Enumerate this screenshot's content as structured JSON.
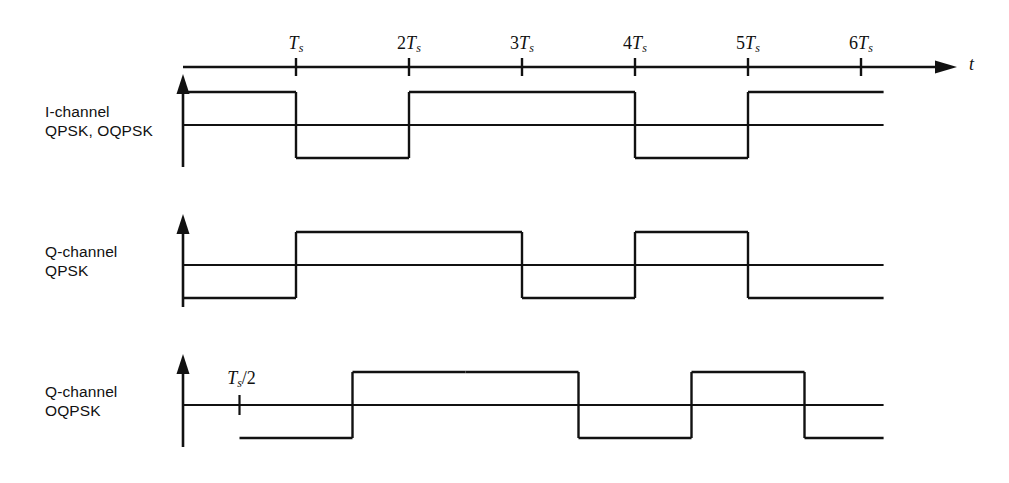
{
  "figure": {
    "background_color": "#ffffff",
    "line_color": "#111111"
  },
  "axis": {
    "time_axis_name": "t",
    "tick_labels": [
      {
        "label_prefix": "",
        "symbol": "T",
        "subscript": "s",
        "value": 1
      },
      {
        "label_prefix": "2",
        "symbol": "T",
        "subscript": "s",
        "value": 2
      },
      {
        "label_prefix": "3",
        "symbol": "T",
        "subscript": "s",
        "value": 3
      },
      {
        "label_prefix": "4",
        "symbol": "T",
        "subscript": "s",
        "value": 4
      },
      {
        "label_prefix": "5",
        "symbol": "T",
        "subscript": "s",
        "value": 5
      },
      {
        "label_prefix": "6",
        "symbol": "T",
        "subscript": "s",
        "value": 6
      }
    ],
    "offset_annotation": {
      "symbol": "T",
      "subscript": "s",
      "suffix": "/2",
      "value": 0.5
    }
  },
  "traces": [
    {
      "id": "i-channel",
      "label_line1": "I-channel",
      "label_line2": "QPSK, OQPSK",
      "delay": 0,
      "start": 0,
      "end": 6.2
    },
    {
      "id": "q-channel-qpsk",
      "label_line1": "Q-channel",
      "label_line2": "QPSK",
      "delay": 0,
      "start": 0,
      "end": 6.2
    },
    {
      "id": "q-channel-oqpsk",
      "label_line1": "Q-channel",
      "label_line2": "OQPSK",
      "delay": 0.5,
      "start": 0.5,
      "end": 6.2
    }
  ],
  "chart_data": {
    "type": "line",
    "xlabel": "t",
    "ylabel": "",
    "xlim": [
      0,
      6.2
    ],
    "ylim": [
      -1.4,
      1.4
    ],
    "grid": false,
    "legend": "none",
    "x_tick_values": [
      1,
      2,
      3,
      4,
      5,
      6
    ],
    "x_tick_labels": [
      "Ts",
      "2Ts",
      "3Ts",
      "4Ts",
      "5Ts",
      "6Ts"
    ],
    "x_unit": "Ts",
    "waveform_style": "NRZ bipolar square wave",
    "series": [
      {
        "name": "I-channel QPSK, OQPSK",
        "delay": 0,
        "levels": [
          1,
          -1,
          1,
          1,
          -1,
          1
        ],
        "segments": [
          {
            "t_start": 0,
            "t_end": 1,
            "level": 1
          },
          {
            "t_start": 1,
            "t_end": 2,
            "level": -1
          },
          {
            "t_start": 2,
            "t_end": 3,
            "level": 1
          },
          {
            "t_start": 3,
            "t_end": 4,
            "level": 1
          },
          {
            "t_start": 4,
            "t_end": 5,
            "level": -1
          },
          {
            "t_start": 5,
            "t_end": 6.2,
            "level": 1
          }
        ]
      },
      {
        "name": "Q-channel QPSK",
        "delay": 0,
        "levels": [
          -1,
          1,
          1,
          -1,
          1,
          -1
        ],
        "segments": [
          {
            "t_start": 0,
            "t_end": 1,
            "level": -1
          },
          {
            "t_start": 1,
            "t_end": 2,
            "level": 1
          },
          {
            "t_start": 2,
            "t_end": 3,
            "level": 1
          },
          {
            "t_start": 3,
            "t_end": 4,
            "level": -1
          },
          {
            "t_start": 4,
            "t_end": 5,
            "level": 1
          },
          {
            "t_start": 5,
            "t_end": 6.2,
            "level": -1
          }
        ]
      },
      {
        "name": "Q-channel OQPSK",
        "delay": 0.5,
        "levels": [
          -1,
          1,
          1,
          -1,
          1,
          -1
        ],
        "segments": [
          {
            "t_start": 0.5,
            "t_end": 1.5,
            "level": -1
          },
          {
            "t_start": 1.5,
            "t_end": 2.5,
            "level": 1
          },
          {
            "t_start": 2.5,
            "t_end": 3.5,
            "level": 1
          },
          {
            "t_start": 3.5,
            "t_end": 4.5,
            "level": -1
          },
          {
            "t_start": 4.5,
            "t_end": 5.5,
            "level": 1
          },
          {
            "t_start": 5.5,
            "t_end": 6.2,
            "level": -1
          }
        ]
      }
    ]
  },
  "geometry": {
    "origin_x": 183,
    "ts_px": 113,
    "axis_end_x": 955,
    "trace_baselines": [
      125,
      265,
      405
    ],
    "amplitude_px": 33,
    "arrow_top_offset": 42,
    "axis_bottom_offset": 42,
    "tick_half": 9,
    "tick_row_offset": -58
  }
}
